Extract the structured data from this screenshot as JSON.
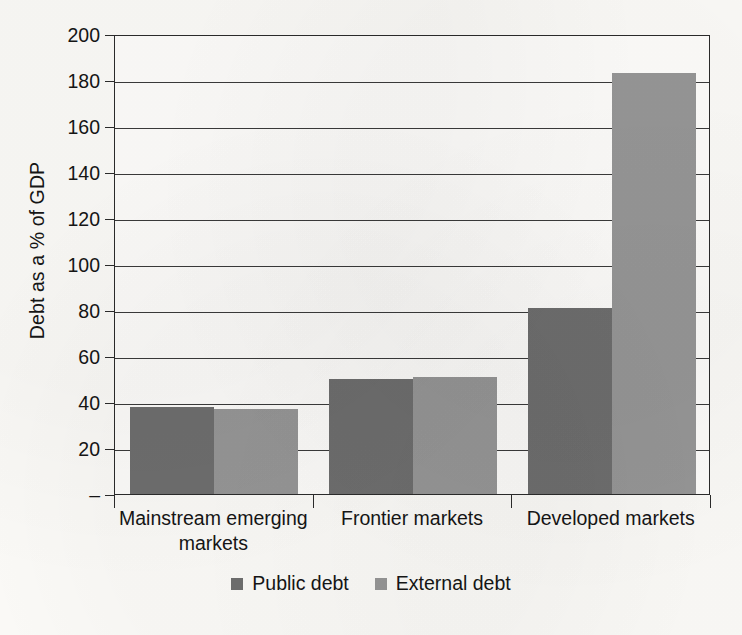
{
  "chart_data": {
    "type": "bar",
    "title": "",
    "subtitle": "",
    "xlabel": "",
    "ylabel": "Debt as a % of GDP",
    "categories": [
      "Mainstream emerging markets",
      "Frontier markets",
      "Developed markets"
    ],
    "series": [
      {
        "name": "Public debt",
        "values": [
          38,
          50,
          81
        ],
        "color": "#6e6e6e"
      },
      {
        "name": "External debt",
        "values": [
          37,
          51,
          183
        ],
        "color": "#969696"
      }
    ],
    "ylim": [
      0,
      200
    ],
    "ytick_values": [
      0,
      20,
      40,
      60,
      80,
      100,
      120,
      140,
      160,
      180,
      200
    ],
    "ytick_labels": [
      "–",
      "20",
      "40",
      "60",
      "80",
      "100",
      "120",
      "140",
      "160",
      "180",
      "200"
    ],
    "grid": true,
    "grid_axis": "y",
    "legend_position": "bottom",
    "bar_gap": 0,
    "group_gap": true
  },
  "legend": {
    "items": [
      {
        "label": "Public debt",
        "color": "#6e6e6e"
      },
      {
        "label": "External debt",
        "color": "#969696"
      }
    ]
  },
  "axis": {
    "y_title": "Debt as a % of GDP"
  },
  "colors": {
    "background": "#fbfaf7",
    "plot_background": "#fdfcfa",
    "axis_line": "#2b2b2b",
    "gridline": "#3a3a3a",
    "text": "#151515",
    "series_public": "#6e6e6e",
    "series_external": "#969696"
  }
}
